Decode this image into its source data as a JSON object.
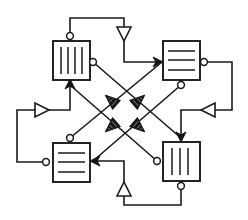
{
  "diagram": {
    "type": "block-diagram",
    "canvas": {
      "width": 248,
      "height": 220,
      "background": "#ffffff"
    },
    "stroke_color": "#1a1a1a",
    "fill_color": "#ffffff",
    "arrow_fill_color": "#161616",
    "nodes": [
      {
        "id": "node-top-left",
        "name": "top-left-block",
        "x": 53,
        "y": 41,
        "w": 37,
        "h": 39,
        "glyph": "vertical-bars",
        "bars": 4
      },
      {
        "id": "node-top-right",
        "name": "top-right-block",
        "x": 163,
        "y": 41,
        "w": 37,
        "h": 39,
        "glyph": "horizontal-rules",
        "bars": 3
      },
      {
        "id": "node-bottom-left",
        "name": "bottom-left-block",
        "x": 53,
        "y": 143,
        "w": 37,
        "h": 39,
        "glyph": "horizontal-rules",
        "bars": 3
      },
      {
        "id": "node-bottom-right",
        "name": "bottom-right-block",
        "x": 163,
        "y": 142,
        "w": 37,
        "h": 39,
        "glyph": "vertical-bars",
        "bars": 3
      }
    ],
    "ports": [
      {
        "name": "port-top-left-top",
        "cx": 70,
        "cy": 36,
        "r": 3.4,
        "style": "open-circle"
      },
      {
        "name": "port-top-left-right",
        "cx": 93,
        "cy": 62,
        "r": 3.4,
        "style": "open-circle"
      },
      {
        "name": "port-top-right-right",
        "cx": 204,
        "cy": 62,
        "r": 3.4,
        "style": "open-circle"
      },
      {
        "name": "port-top-right-bottom",
        "cx": 181,
        "cy": 85,
        "r": 3.4,
        "style": "open-circle"
      },
      {
        "name": "port-bottom-left-top",
        "cx": 70,
        "cy": 138,
        "r": 3.4,
        "style": "open-circle"
      },
      {
        "name": "port-bottom-left-left",
        "cx": 46,
        "cy": 162,
        "r": 3.4,
        "style": "open-circle"
      },
      {
        "name": "port-bottom-right-left",
        "cx": 157,
        "cy": 161,
        "r": 3.4,
        "style": "open-circle"
      },
      {
        "name": "port-bottom-right-bottom",
        "cx": 181,
        "cy": 186,
        "r": 3.4,
        "style": "open-circle"
      }
    ],
    "connectors_filled": [
      {
        "name": "connector-top-left-bottom",
        "x": 70,
        "y": 85,
        "dir": "up"
      },
      {
        "name": "connector-top-right-left",
        "x": 162,
        "y": 62,
        "dir": "right"
      },
      {
        "name": "connector-bottom-left-right",
        "x": 93,
        "y": 161,
        "dir": "left"
      },
      {
        "name": "connector-bottom-right-top",
        "x": 181,
        "y": 138,
        "dir": "down"
      }
    ],
    "center_arrows": [
      {
        "name": "center-arrow-upper-left",
        "x": 112,
        "y": 100,
        "dir": "down-left",
        "style": "filled-hatched"
      },
      {
        "name": "center-arrow-upper-right",
        "x": 137,
        "y": 100,
        "dir": "down-right",
        "style": "filled-hatched"
      },
      {
        "name": "center-arrow-lower-left",
        "x": 112,
        "y": 125,
        "dir": "up-left",
        "style": "filled-hatched"
      },
      {
        "name": "center-arrow-lower-right",
        "x": 137,
        "y": 125,
        "dir": "up-right",
        "style": "filled-hatched"
      }
    ],
    "open_arrows": [
      {
        "name": "open-arrow-top",
        "x": 124,
        "y": 33,
        "dir": "down",
        "style": "open-triangle"
      },
      {
        "name": "open-arrow-left",
        "x": 41,
        "y": 110,
        "dir": "right",
        "style": "open-triangle"
      },
      {
        "name": "open-arrow-right",
        "x": 209,
        "y": 110,
        "dir": "left",
        "style": "open-triangle"
      },
      {
        "name": "open-arrow-bottom",
        "x": 124,
        "y": 190,
        "dir": "up",
        "style": "open-triangle"
      }
    ],
    "diagonal_edges": [
      {
        "name": "edge-tl-to-br",
        "from": "node-top-left",
        "to": "node-bottom-right",
        "path": "M 93 62 L 181 138"
      },
      {
        "name": "edge-bl-to-tr",
        "from": "node-bottom-left",
        "to": "node-top-right",
        "path": "M 70 138 L 162 62"
      },
      {
        "name": "edge-tr-to-bl",
        "from": "node-top-right",
        "to": "node-bottom-left",
        "path": "M 181 85 L 93 161"
      },
      {
        "name": "edge-br-to-tl",
        "from": "node-bottom-right",
        "to": "node-top-left",
        "path": "M 157 161 L 70 85"
      }
    ],
    "routing_edges": [
      {
        "name": "route-top",
        "path": "M 70 36 L 70 18 L 124 18 L 124 62 L 162 62",
        "waypoints": 5
      },
      {
        "name": "route-right",
        "path": "M 204 62 L 232 62 L 232 110 L 181 110 L 181 138",
        "waypoints": 5
      },
      {
        "name": "route-bottom",
        "path": "M 181 186 L 181 205 L 124 205 L 124 161 L 93 161",
        "waypoints": 5
      },
      {
        "name": "route-left",
        "path": "M 46 162 L 17 162 L 17 110 L 70 110 L 70 85",
        "waypoints": 5
      }
    ]
  }
}
